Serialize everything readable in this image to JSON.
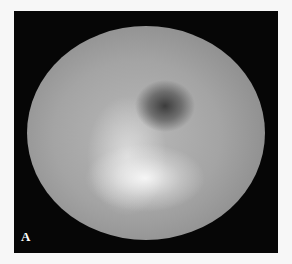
{
  "figure": {
    "panel_label": "A",
    "background_color": "#f7f7f7",
    "panel_color": "#060606"
  }
}
